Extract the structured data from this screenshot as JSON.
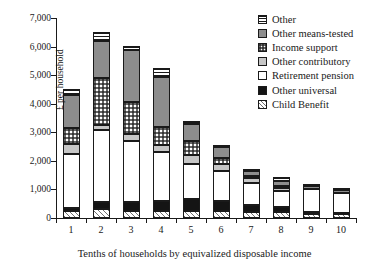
{
  "chart_data": {
    "type": "bar",
    "stacked": true,
    "title": "",
    "xlabel": "Tenths of households by equivalized disposable income",
    "ylabel": "£ per household",
    "categories": [
      "1",
      "2",
      "3",
      "4",
      "5",
      "6",
      "7",
      "8",
      "9",
      "10"
    ],
    "ylim": [
      0,
      7000
    ],
    "ytick_values": [
      0,
      1000,
      2000,
      3000,
      4000,
      5000,
      6000,
      7000
    ],
    "ytick_labels": [
      "0",
      "1,000",
      "2,000",
      "3,000",
      "4,000",
      "5,000",
      "6,000",
      "7,000"
    ],
    "grid": false,
    "legend_position": "top-right",
    "series": [
      {
        "name": "Child Benefit",
        "pattern": "diagonal-hatch",
        "values": [
          260,
          300,
          250,
          240,
          240,
          240,
          210,
          200,
          140,
          150
        ]
      },
      {
        "name": "Other universal",
        "pattern": "solid-black",
        "values": [
          90,
          250,
          300,
          360,
          410,
          350,
          260,
          190,
          70,
          40
        ]
      },
      {
        "name": "Retirement pension",
        "pattern": "solid-white",
        "values": [
          1900,
          2520,
          2150,
          1700,
          1230,
          1070,
          760,
          560,
          800,
          690
        ]
      },
      {
        "name": "Other contributory",
        "pattern": "light-gray",
        "values": [
          350,
          170,
          240,
          240,
          310,
          230,
          170,
          110,
          0,
          0
        ]
      },
      {
        "name": "Income support",
        "pattern": "checkerboard",
        "values": [
          560,
          1650,
          1120,
          630,
          490,
          210,
          80,
          60,
          0,
          0
        ]
      },
      {
        "name": "Other means-tested",
        "pattern": "dark-gray",
        "values": [
          1130,
          1300,
          1810,
          1780,
          620,
          380,
          150,
          190,
          120,
          100
        ]
      },
      {
        "name": "Other",
        "pattern": "horizontal-lines",
        "values": [
          230,
          310,
          160,
          300,
          100,
          90,
          90,
          110,
          50,
          50
        ]
      }
    ],
    "totals": [
      4520,
      6500,
      6030,
      5250,
      4400,
      2570,
      1720,
      1420,
      1180,
      1030
    ]
  },
  "legend": {
    "items": [
      {
        "label": "Other"
      },
      {
        "label": "Other means-tested"
      },
      {
        "label": "Income support"
      },
      {
        "label": "Other contributory"
      },
      {
        "label": "Retirement pension"
      },
      {
        "label": "Other universal"
      },
      {
        "label": "Child Benefit"
      }
    ]
  }
}
